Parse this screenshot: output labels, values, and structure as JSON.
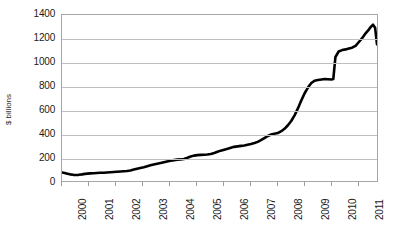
{
  "chart_data": {
    "type": "line",
    "title": "",
    "xlabel": "",
    "ylabel": "$ billions",
    "ylim": [
      0,
      1400
    ],
    "yticks": [
      0,
      200,
      400,
      600,
      800,
      1000,
      1200,
      1400
    ],
    "ytick_labels": [
      "0",
      "200",
      "400",
      "600",
      "800",
      "1000",
      "1200",
      "1400"
    ],
    "xlim": [
      2000,
      2011.75
    ],
    "xticks": [
      2000,
      2001,
      2002,
      2003,
      2004,
      2005,
      2006,
      2007,
      2008,
      2009,
      2010,
      2011
    ],
    "xtick_labels": [
      "2000",
      "2001",
      "2002",
      "2003",
      "2004",
      "2005",
      "2006",
      "2007",
      "2008",
      "2009",
      "2010",
      "2011"
    ],
    "grid": "horizontal",
    "legend": "none",
    "series": [
      {
        "name": "series-1",
        "color": "#000000",
        "line_width": 2.6,
        "x": [
          2000.0,
          2000.1,
          2000.2,
          2000.3,
          2000.42,
          2000.52,
          2000.62,
          2000.75,
          2000.85,
          2000.95,
          2001.05,
          2001.18,
          2001.3,
          2001.42,
          2001.55,
          2001.68,
          2001.8,
          2001.92,
          2002.05,
          2002.18,
          2002.3,
          2002.42,
          2002.55,
          2002.68,
          2002.8,
          2002.92,
          2003.05,
          2003.18,
          2003.3,
          2003.42,
          2003.55,
          2003.68,
          2003.8,
          2003.92,
          2004.05,
          2004.18,
          2004.3,
          2004.42,
          2004.55,
          2004.68,
          2004.8,
          2004.92,
          2005.05,
          2005.18,
          2005.3,
          2005.42,
          2005.55,
          2005.68,
          2005.8,
          2005.92,
          2006.05,
          2006.18,
          2006.3,
          2006.42,
          2006.55,
          2006.68,
          2006.8,
          2006.92,
          2007.05,
          2007.18,
          2007.3,
          2007.42,
          2007.55,
          2007.68,
          2007.8,
          2007.92,
          2008.05,
          2008.18,
          2008.3,
          2008.42,
          2008.55,
          2008.68,
          2008.8,
          2008.92,
          2009.05,
          2009.18,
          2009.3,
          2009.42,
          2009.55,
          2009.68,
          2009.8,
          2009.92,
          2010.05,
          2010.12,
          2010.2,
          2010.32,
          2010.45,
          2010.58,
          2010.7,
          2010.82,
          2010.95,
          2011.05,
          2011.18,
          2011.3,
          2011.42,
          2011.52,
          2011.6,
          2011.68,
          2011.75
        ],
        "y": [
          72,
          68,
          62,
          56,
          52,
          50,
          52,
          56,
          60,
          62,
          64,
          66,
          68,
          70,
          70,
          72,
          74,
          76,
          78,
          80,
          82,
          84,
          88,
          96,
          104,
          110,
          116,
          124,
          132,
          140,
          146,
          152,
          158,
          164,
          170,
          176,
          180,
          182,
          186,
          196,
          206,
          214,
          218,
          220,
          222,
          224,
          228,
          236,
          246,
          256,
          264,
          272,
          280,
          288,
          292,
          296,
          300,
          306,
          312,
          320,
          330,
          344,
          362,
          380,
          392,
          398,
          404,
          420,
          440,
          468,
          506,
          556,
          612,
          676,
          740,
          790,
          826,
          846,
          852,
          856,
          860,
          858,
          856,
          860,
          1046,
          1092,
          1104,
          1110,
          1118,
          1124,
          1140,
          1166,
          1200,
          1238,
          1270,
          1300,
          1318,
          1292,
          1152
        ]
      }
    ]
  }
}
